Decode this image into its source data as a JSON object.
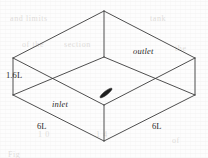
{
  "figure": {
    "kind": "isometric-line-diagram",
    "background_color": "#fdfdfd",
    "line_color": "#3a3a3a",
    "text_color": "#2b2b2b",
    "obstacle_color": "#1f1f1f"
  },
  "labels": {
    "height": "1.6L",
    "width_left": "6L",
    "width_right": "6L",
    "inlet": "inlet",
    "outlet": "outlet"
  },
  "geometry": {
    "top_back_vertex": "104,11",
    "top_left_vertex": "13,58",
    "top_right_vertex": "195,58",
    "top_front_vertex": "104,105",
    "bottom_left_vertex": "13,95",
    "bottom_right_vertex": "195,95",
    "bottom_front_vertex": "104,141",
    "inner_floor_back_vertex": "104,57"
  },
  "obstacle": {
    "name": "floor-obstacle",
    "center": "106,93",
    "rotation_deg": -38,
    "length_px": 15,
    "thickness_px": 4
  },
  "scan_ghost_text": [
    {
      "text": "and limits",
      "left": 10,
      "top": 14
    },
    {
      "text": "tank",
      "left": 150,
      "top": 14
    },
    {
      "text": "of the",
      "left": 22,
      "top": 40
    },
    {
      "text": "section",
      "left": 64,
      "top": 40
    },
    {
      "text": "the",
      "left": 175,
      "top": 44
    },
    {
      "text": "1 0",
      "left": 38,
      "top": 130
    },
    {
      "text": "1 4",
      "left": 96,
      "top": 130
    },
    {
      "text": "of",
      "left": 172,
      "top": 136
    },
    {
      "text": "Fig",
      "left": 8,
      "top": 150
    }
  ]
}
